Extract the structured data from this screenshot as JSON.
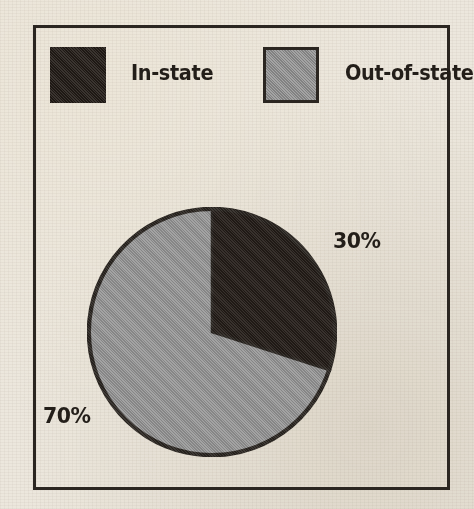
{
  "figure": {
    "background_color": "#ece7dd",
    "frame_color": "#2b2621"
  },
  "legend": {
    "items": [
      {
        "label": "In-state",
        "color": "#241d18",
        "swatch_name": "dark-swatch"
      },
      {
        "label": "Out-of-state",
        "color": "#9a9a9a",
        "swatch_name": "gray-swatch"
      }
    ]
  },
  "labels": {
    "in_state_pct": "30%",
    "out_of_state_pct": "70%"
  },
  "chart_data": {
    "type": "pie",
    "title": "",
    "categories": [
      "In-state",
      "Out-of-state"
    ],
    "values": [
      30,
      70
    ],
    "value_labels": [
      "30%",
      "70%"
    ],
    "colors": [
      "#241d18",
      "#9a9a9a"
    ],
    "units": "percent",
    "total": 100,
    "start_angle_deg": 0,
    "direction": "clockwise",
    "legend": "top",
    "grid": false,
    "slices": [
      {
        "name": "In-state",
        "value": 30,
        "label": "30%",
        "color": "#241d18",
        "start_deg": 0,
        "end_deg": 108
      },
      {
        "name": "Out-of-state",
        "value": 70,
        "label": "70%",
        "color": "#9a9a9a",
        "start_deg": 108,
        "end_deg": 360
      }
    ]
  }
}
